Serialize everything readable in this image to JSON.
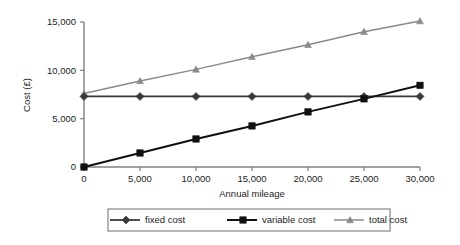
{
  "chart_data": {
    "type": "line",
    "title": "",
    "xlabel": "Annual mileage",
    "ylabel": "Cost (£)",
    "x": [
      0,
      5000,
      10000,
      15000,
      20000,
      25000,
      30000
    ],
    "xtick_labels": [
      "0",
      "5,000",
      "10,000",
      "15,000",
      "20,000",
      "25,000",
      "30,000"
    ],
    "ytick_labels": [
      "0",
      "5,000",
      "10,000",
      "15,000"
    ],
    "yticks": [
      0,
      5000,
      10000,
      15000
    ],
    "xlim": [
      0,
      30000
    ],
    "ylim": [
      0,
      15000
    ],
    "grid": false,
    "legend_position": "bottom",
    "series": [
      {
        "name": "fixed cost",
        "marker": "diamond",
        "color": "#3a3a3a",
        "values": [
          7300,
          7300,
          7300,
          7300,
          7300,
          7300,
          7300
        ]
      },
      {
        "name": "variable cost",
        "marker": "square",
        "color": "#111111",
        "values": [
          0,
          1450,
          2900,
          4250,
          5700,
          7050,
          8450
        ]
      },
      {
        "name": "total cost",
        "marker": "triangle",
        "color": "#8a8a8a",
        "values": [
          7600,
          8900,
          10100,
          11400,
          12650,
          14000,
          15100
        ]
      }
    ]
  },
  "legend": {
    "items": [
      {
        "label": "fixed cost"
      },
      {
        "label": "variable cost"
      },
      {
        "label": "total cost"
      }
    ]
  },
  "axis": {
    "x_title": "Annual mileage",
    "y_title": "Cost (£)"
  },
  "colors": {
    "axis": "#808080",
    "fixed": "#3a3a3a",
    "variable": "#111111",
    "total": "#8a8a8a",
    "legend_border": "#6e6e6e",
    "background": "#ffffff"
  }
}
